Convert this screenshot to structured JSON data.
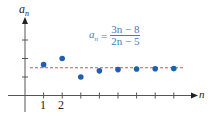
{
  "chart_data": {
    "type": "scatter",
    "title": "",
    "formula": {
      "lhs": "a",
      "lhs_sub": "n",
      "equals": "=",
      "numerator": "3n − 8",
      "denominator": "2n − 5"
    },
    "xlabel": "n",
    "ylabel": "a",
    "ylabel_sub": "n",
    "x_tick_labels": [
      "1",
      "2"
    ],
    "x": [
      1,
      2,
      3,
      4,
      5,
      6,
      7,
      8
    ],
    "values": [
      1.667,
      2.0,
      1.0,
      1.333,
      1.4,
      1.429,
      1.444,
      1.455
    ],
    "asymptote": {
      "y": 1.5,
      "style": "dashed",
      "color": "#e05050"
    },
    "point_color": "#1f5fae",
    "ylim": [
      0,
      3
    ],
    "xlim": [
      0,
      8.5
    ],
    "grid": false,
    "legend": null
  }
}
